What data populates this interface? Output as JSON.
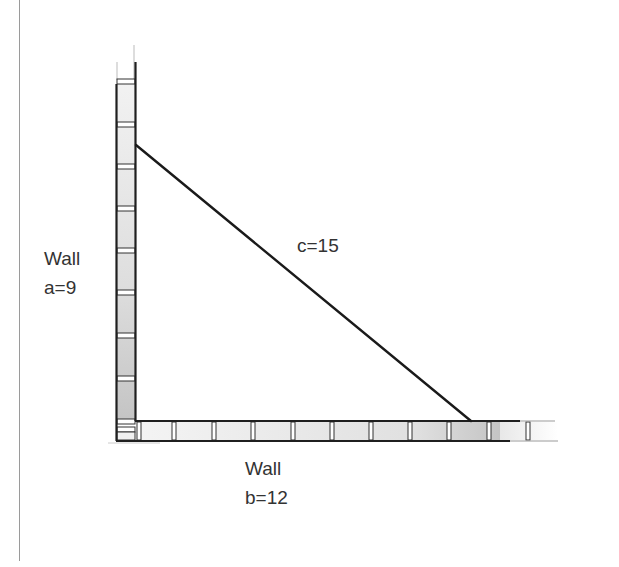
{
  "diagram": {
    "type": "right-triangle-walls",
    "labels": {
      "wall_a_title": "Wall",
      "wall_a_value": "a=9",
      "hypotenuse": "c=15",
      "wall_b_title": "Wall",
      "wall_b_value": "b=12"
    },
    "sides": {
      "a": 9,
      "b": 12,
      "c": 15
    },
    "colors": {
      "line": "#1a1a1a",
      "brick_fill": "#e6e6e6",
      "brick_shade": "#bdbdbd",
      "border": "#9a9a9a"
    }
  }
}
